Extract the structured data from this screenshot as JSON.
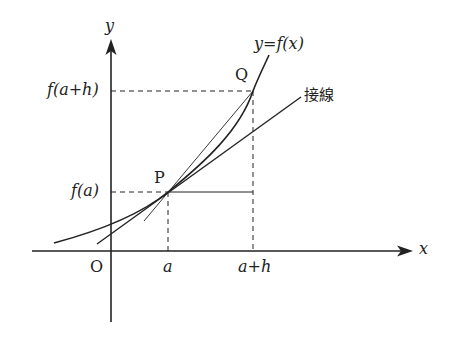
{
  "diagram": {
    "axes": {
      "x_label": "x",
      "y_label": "y",
      "origin_label": "O"
    },
    "curve_label": "y=f(x)",
    "tangent_label": "接線",
    "points": {
      "P": {
        "label": "P"
      },
      "Q": {
        "label": "Q"
      }
    },
    "x_ticks": [
      "a",
      "a+h"
    ],
    "y_ticks": [
      "f(a)",
      "f(a+h)"
    ],
    "colors": {
      "line": "#222222",
      "background": "#ffffff"
    }
  }
}
